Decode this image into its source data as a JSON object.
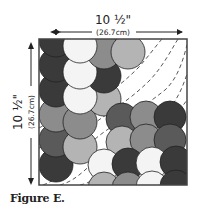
{
  "figure": {
    "caption": "Figure E.",
    "width_label": "10 ½\"",
    "width_metric": "(26.7cm)",
    "height_label": "10 ½\"",
    "height_metric": "(26.7cm)",
    "colors": {
      "black": "#3a3a3a",
      "dark": "#5a5a5a",
      "mid": "#8c8c8c",
      "light": "#b4b4b4",
      "white": "#f4f4f4",
      "outline": "#222222",
      "border": "#444444"
    }
  }
}
